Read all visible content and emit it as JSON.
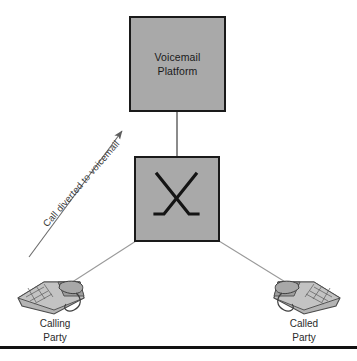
{
  "diagram": {
    "title_node": {
      "line1": "Voicemail",
      "line2": "Platform"
    },
    "switch_node": {
      "symbol_name": "crossed-lines-switch-symbol"
    },
    "annotation": {
      "divert_text": "Call diverted to voicemail"
    },
    "endpoints": [
      {
        "id": "calling-party",
        "line1": "Calling",
        "line2": "Party"
      },
      {
        "id": "called-party",
        "line1": "Called",
        "line2": "Party"
      }
    ],
    "colors": {
      "box_fill": "#a9a9a9",
      "box_border": "#1a1a1a",
      "wire": "#8a8a8a",
      "arrow": "#6b6b6b",
      "text": "#1a1a1a",
      "rule": "#111111"
    }
  }
}
